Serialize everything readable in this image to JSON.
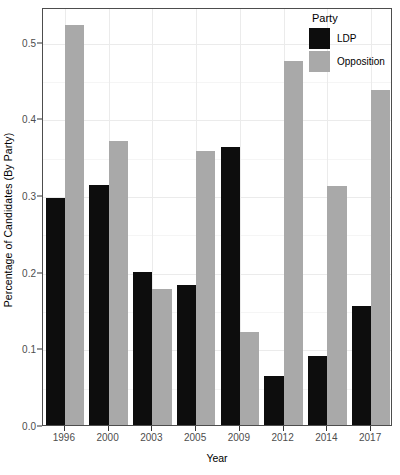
{
  "chart_data": {
    "type": "bar",
    "title": "",
    "xlabel": "Year",
    "ylabel": "Percentage of Candidates (By Party)",
    "categories": [
      "1996",
      "2000",
      "2003",
      "2005",
      "2009",
      "2012",
      "2014",
      "2017"
    ],
    "series": [
      {
        "name": "LDP",
        "color": "#0d0d0d",
        "values": [
          0.296,
          0.313,
          0.199,
          0.182,
          0.363,
          0.064,
          0.09,
          0.155
        ]
      },
      {
        "name": "Opposition",
        "color": "#a9a9a9",
        "values": [
          0.521,
          0.37,
          0.177,
          0.357,
          0.121,
          0.475,
          0.311,
          0.437
        ]
      }
    ],
    "ylim": [
      0.0,
      0.545
    ],
    "yticks": [
      0.0,
      0.1,
      0.2,
      0.3,
      0.4,
      0.5
    ],
    "ytick_labels": [
      "0.0",
      "0.1",
      "0.2",
      "0.3",
      "0.4",
      "0.5"
    ],
    "yminor_ticks": [
      0.05,
      0.15,
      0.25,
      0.35,
      0.45
    ],
    "grid": true,
    "legend_position": "top-right",
    "legend_title": "Party"
  },
  "legend": {
    "title": "Party",
    "items": [
      {
        "label": "LDP",
        "color": "#0d0d0d"
      },
      {
        "label": "Opposition",
        "color": "#a9a9a9"
      }
    ]
  },
  "axes": {
    "x_title": "Year",
    "y_title": "Percentage of Candidates (By Party)"
  }
}
